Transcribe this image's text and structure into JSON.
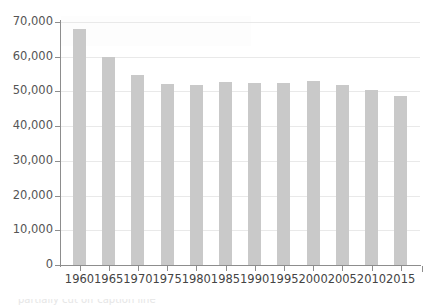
{
  "chart_data": {
    "type": "bar",
    "title": "",
    "subtitle": "",
    "xlabel": "",
    "ylabel": "",
    "categories": [
      "1960",
      "1965",
      "1970",
      "1975",
      "1980",
      "1985",
      "1990",
      "1995",
      "2000",
      "2005",
      "2010",
      "2015"
    ],
    "values": [
      68000,
      60000,
      54700,
      52200,
      51900,
      52800,
      52400,
      52500,
      53000,
      52000,
      50300,
      48700
    ],
    "series": [
      {
        "name": "",
        "values": [
          68000,
          60000,
          54700,
          52200,
          51900,
          52800,
          52400,
          52500,
          53000,
          52000,
          50300,
          48700
        ]
      }
    ],
    "ylim": [
      0,
      70000
    ],
    "y_ticks": [
      0,
      10000,
      20000,
      30000,
      40000,
      50000,
      60000,
      70000
    ],
    "y_tick_labels": [
      "0",
      "10,000",
      "20,000",
      "30,000",
      "40,000",
      "50,000",
      "60,000",
      "70,000"
    ],
    "x_tick_labels": [
      "1960",
      "1965",
      "1970",
      "1975",
      "1980",
      "1985",
      "1990",
      "1995",
      "2000",
      "2005",
      "2010",
      "2015"
    ],
    "grid": true,
    "grid_axis": "y",
    "legend": false,
    "legend_position": "none",
    "bar_color": "#c9c9c9",
    "gridline_color": "#e9e9e9",
    "axis_color": "#8d8d8d",
    "tick_label_color": "#555555",
    "background_color": "#ffffff",
    "annotations": []
  },
  "caption": {
    "clipped_text": "partially cut off caption line"
  }
}
